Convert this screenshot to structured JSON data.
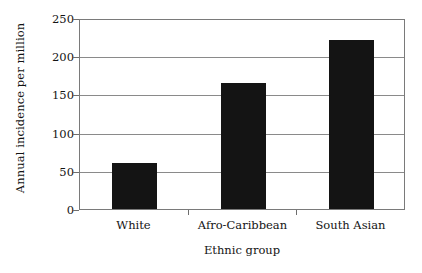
{
  "chart_data": {
    "type": "bar",
    "title": "",
    "xlabel": "Ethnic group",
    "ylabel": "Annual incidence per million",
    "categories": [
      "White",
      "Afro-Caribbean",
      "South Asian"
    ],
    "values": [
      60,
      165,
      221
    ],
    "ylim": [
      0,
      250
    ],
    "yticks": [
      0,
      50,
      100,
      150,
      200,
      250
    ],
    "ytick_labels": [
      "0",
      "50",
      "100",
      "150",
      "200",
      "250"
    ],
    "grid": "horizontal",
    "legend": "none",
    "bar_color": "#141414",
    "grid_color": "#8a8a8a",
    "axis_color": "#7a7a7a",
    "background": "#ffffff"
  }
}
